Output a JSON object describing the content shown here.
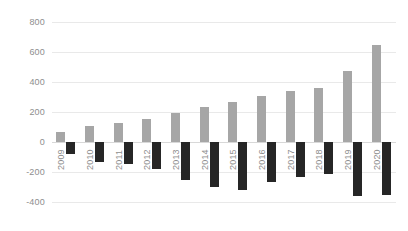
{
  "chart_data": {
    "type": "bar",
    "title": "",
    "subtitle": "",
    "xlabel": "",
    "ylabel": "",
    "grid": true,
    "legend": "none",
    "ylim": [
      -400,
      800
    ],
    "ytick_step": 200,
    "yticks": [
      "800",
      "600",
      "400",
      "200",
      "0",
      "-200",
      "-400"
    ],
    "ytick_values": [
      800,
      600,
      400,
      200,
      0,
      -200,
      -400
    ],
    "categories": [
      "2009",
      "2010",
      "2011",
      "2012",
      "2013",
      "2014",
      "2015",
      "2016",
      "2017",
      "2018",
      "2019",
      "2020"
    ],
    "series": [
      {
        "name": "positive",
        "color": "#a6a6a6",
        "values": [
          70,
          105,
          125,
          155,
          195,
          235,
          270,
          310,
          340,
          360,
          475,
          650
        ]
      },
      {
        "name": "negative",
        "color": "#262626",
        "values": [
          -80,
          -135,
          -145,
          -180,
          -250,
          -300,
          -320,
          -265,
          -235,
          -215,
          -360,
          -355
        ]
      }
    ]
  },
  "colors": {
    "positive_bar": "#a6a6a6",
    "negative_bar": "#262626",
    "gridline": "#e9e9e9",
    "zeroline": "#d8d8d8",
    "tick_text": "#8e8e8e",
    "background": "#ffffff"
  }
}
